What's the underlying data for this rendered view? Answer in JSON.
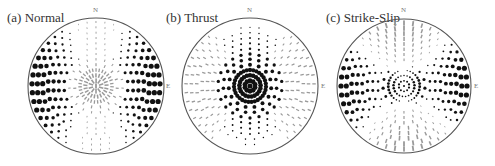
{
  "figure": {
    "panels": [
      {
        "id": "a",
        "title": "(a) Normal",
        "labels": {
          "north": "N",
          "east": "E"
        },
        "center": [
          96,
          86
        ],
        "radius": 68,
        "title_pos": [
          7,
          10
        ],
        "pattern": "normal"
      },
      {
        "id": "b",
        "title": "(b) Thrust",
        "labels": {
          "north": "N",
          "east": "E"
        },
        "center": [
          250,
          86
        ],
        "radius": 68,
        "title_pos": [
          166,
          10
        ],
        "pattern": "thrust"
      },
      {
        "id": "c",
        "title": "(c) Strike-Slip",
        "labels": {
          "north": "N",
          "east": "E"
        },
        "center": [
          404,
          86
        ],
        "radius": 67,
        "title_pos": [
          325,
          10
        ],
        "pattern": "strikeslip"
      }
    ],
    "legend_semantics": {
      "black_dot": "compression / positive amplitude",
      "gray_dash": "dilatation / negative amplitude"
    },
    "colors": {
      "outline": "#555555",
      "positive": "#111111",
      "negative": "#9a9a9a"
    }
  }
}
